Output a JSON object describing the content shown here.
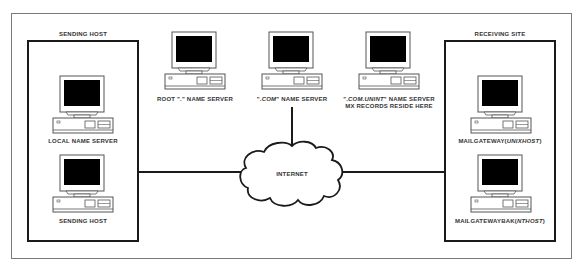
{
  "diagram": {
    "groups": {
      "sending": {
        "label": "SENDING HOST"
      },
      "receiving": {
        "label": "RECEIVING SITE"
      }
    },
    "nodes": {
      "local_name_server": {
        "label": "LOCAL NAME SERVER"
      },
      "sending_host": {
        "label": "SENDING HOST"
      },
      "root_name_server": {
        "label": "ROOT \".\" NAME SERVER"
      },
      "com_name_server": {
        "prefix": "\".",
        "italic": "COM",
        "suffix": "\" NAME SERVER"
      },
      "unint_name_server": {
        "prefix": "\".",
        "italic": "COM.UNINT",
        "suffix": "\" NAME SERVER",
        "line2": "MX RECORDS RESIDE HERE"
      },
      "mailgateway": {
        "prefix": "MAILGATEWAY(",
        "italic": "UNIXHOST",
        "suffix": ")"
      },
      "mailgatewaybak": {
        "prefix": "MAILGATEWAYBAK(",
        "italic": "NTHOST",
        "suffix": ")"
      },
      "internet": {
        "label": "INTERNET"
      }
    },
    "connections": [
      {
        "from": "sending",
        "to": "internet"
      },
      {
        "from": "com_name_server",
        "to": "internet"
      },
      {
        "from": "internet",
        "to": "receiving"
      }
    ],
    "colors": {
      "line": "#1a1a1a",
      "frame": "#7a7a7a",
      "screen": "#000000",
      "text": "#333333"
    }
  }
}
